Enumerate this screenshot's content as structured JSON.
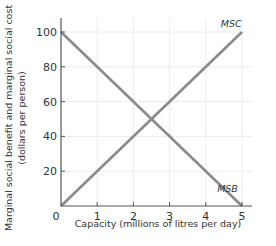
{
  "chart_data": {
    "type": "line",
    "title": "",
    "xlabel": "Capacity (millions of litres per day)",
    "ylabel_line1": "Marginal social benefit and marginal social cost",
    "ylabel_line2": "(dollars per person)",
    "xlim": [
      0,
      5
    ],
    "ylim": [
      0,
      100
    ],
    "x_ticks": [
      "0",
      "1",
      "2",
      "3",
      "4",
      "5"
    ],
    "y_ticks": [
      "20",
      "40",
      "60",
      "80",
      "100"
    ],
    "grid": true,
    "series": [
      {
        "name": "MSC",
        "x": [
          0,
          5
        ],
        "values": [
          0,
          100
        ],
        "color": "#8a8a8a"
      },
      {
        "name": "MSB",
        "x": [
          0,
          5
        ],
        "values": [
          100,
          0
        ],
        "color": "#8a8a8a"
      }
    ],
    "annotations": [
      {
        "text": "MSC",
        "x": 4.7,
        "y": 103
      },
      {
        "text": "MSB",
        "x": 4.6,
        "y": 8
      }
    ]
  }
}
